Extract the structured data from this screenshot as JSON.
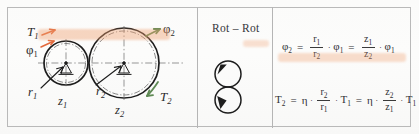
{
  "figure": {
    "kind": "gear-pair-diagram-table",
    "panels": [
      "diagram",
      "type",
      "formulas"
    ]
  },
  "diagram": {
    "labels": {
      "torque_in": "T",
      "torque_in_sub": "1",
      "angle_in": "φ",
      "angle_in_sub": "1",
      "radius_in": "r",
      "radius_in_sub": "1",
      "teeth_in": "z",
      "teeth_in_sub": "1",
      "torque_out": "T",
      "torque_out_sub": "2",
      "angle_out": "φ",
      "angle_out_sub": "2",
      "radius_out": "r",
      "radius_out_sub": "2",
      "teeth_out": "z",
      "teeth_out_sub": "2"
    },
    "colors": {
      "input_arrow": "#e2693c",
      "output_arrow": "#5f8a55",
      "gear_outline": "#1d1d1d",
      "center_line": "#5a5a5a",
      "highlighter": "#f0a070"
    },
    "small_gear": {
      "cx": 66,
      "cy": 63,
      "r": 22
    },
    "large_gear": {
      "cx": 124,
      "cy": 63,
      "r": 35
    }
  },
  "type_panel": {
    "label": "Rot – Rot",
    "symbol_circles": 2,
    "symbol_name": "rotation-rotation-symbol"
  },
  "formulas": {
    "line1": {
      "lhs": "φ",
      "lhs_sub": "2",
      "eq1": "=",
      "frac1_num": "r",
      "frac1_num_sub": "1",
      "frac1_den": "r",
      "frac1_den_sub": "2",
      "dot1": "·",
      "term1": "φ",
      "term1_sub": "1",
      "eq2": "=",
      "frac2_num": "z",
      "frac2_num_sub": "1",
      "frac2_den": "z",
      "frac2_den_sub": "2",
      "dot2": "·",
      "term2": "φ",
      "term2_sub": "1",
      "plain": "φ2 = r1/r2 · φ1 = z1/z2 · φ1"
    },
    "line2": {
      "lhs": "T",
      "lhs_sub": "2",
      "eq1": "=",
      "eta1": "η",
      "dot0": "·",
      "frac1_num": "r",
      "frac1_num_sub": "2",
      "frac1_den": "r",
      "frac1_den_sub": "1",
      "dot1": "·",
      "term1": "T",
      "term1_sub": "1",
      "eq2": "=",
      "eta2": "η",
      "dot2": "·",
      "frac2_num": "z",
      "frac2_num_sub": "2",
      "frac2_den": "z",
      "frac2_den_sub": "1",
      "dot3": "·",
      "term2": "T",
      "term2_sub": "1",
      "plain": "T2 = η · r2/r1 · T1 = η · z2/z1 · T1"
    }
  }
}
